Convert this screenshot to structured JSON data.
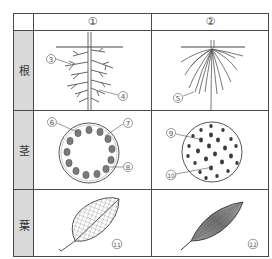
{
  "columns": [
    {
      "label": "①",
      "id": "col-1"
    },
    {
      "label": "②",
      "id": "col-2"
    }
  ],
  "rows": [
    {
      "label": "根",
      "meaning": "root"
    },
    {
      "label": "茎",
      "meaning": "stem"
    },
    {
      "label": "葉",
      "meaning": "leaf"
    }
  ],
  "callouts": {
    "c3": "3",
    "c4": "4",
    "c5": "5",
    "c6": "6",
    "c7": "7",
    "c8": "8",
    "c9": "9",
    "c10": "10",
    "c11": "11",
    "c12": "12"
  },
  "colors": {
    "border": "#4a4a4a",
    "label_column_bg": "#d9d9d9",
    "drawing": "#555555",
    "bundle_fill": "#7a7a7a"
  }
}
